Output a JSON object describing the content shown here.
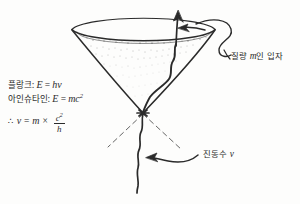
{
  "figure": {
    "kind": "hand-drawn-physics-diagram",
    "background_color": "#fdfdfc",
    "ink_color": "#2b2b2b"
  },
  "equations": {
    "planck": {
      "name_ko": "플랑크",
      "separator": ": ",
      "lhs": "E",
      "equals": " = ",
      "rhs": "hν"
    },
    "einstein": {
      "name_ko": "아인슈타인",
      "separator": ": ",
      "lhs": "E",
      "equals": " = ",
      "rhs_base": "mc",
      "rhs_exponent": "2"
    },
    "conclusion": {
      "therefore": "∴",
      "lhs": "ν",
      "equals": "=",
      "mass": "m",
      "times": "×",
      "numerator": "c",
      "numerator_exponent": "2",
      "denominator": "h"
    }
  },
  "labels": {
    "mass_particle": {
      "prefix": "질량 ",
      "variable": "m",
      "suffix": "인 입자"
    },
    "frequency": {
      "prefix": "진동수 ",
      "variable": "ν"
    }
  },
  "annotations": {
    "spin_arrow": "counter-clockwise-rotation-arrow",
    "up_arrow": "upward-velocity-arrow",
    "wave_line": "oscillating-wave-line",
    "dashed_lines": "cone-axis-guide-dashes",
    "leader_mass": "curved-leader-to-mass-label",
    "leader_freq": "curved-leader-to-frequency-label"
  }
}
